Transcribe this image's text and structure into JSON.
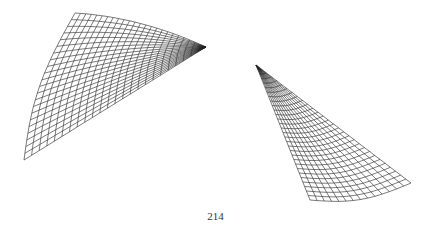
{
  "page": {
    "number": "214"
  },
  "figures": [
    {
      "name": "wireframe-surface-left",
      "description": "wireframe mesh surface, fan-shaped, converging to the right"
    },
    {
      "name": "wireframe-surface-right",
      "description": "wireframe mesh surface, curved blade shape, dense at top"
    }
  ],
  "colors": {
    "line": "#222222",
    "background": "#ffffff"
  }
}
